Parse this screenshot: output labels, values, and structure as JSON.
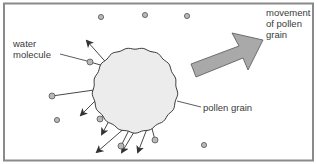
{
  "diagram": {
    "labels": {
      "water_molecule": "water\nmolecule",
      "pollen_grain": "pollen grain",
      "movement": "movement\nof pollen\ngrain"
    },
    "colors": {
      "frame": "#8a8a8a",
      "pollen_fill": "#ececec",
      "pollen_stroke": "#3a3a3a",
      "molecule_fill": "#b8b8b8",
      "molecule_stroke": "#555555",
      "big_arrow_fill": "#a9a9a9",
      "big_arrow_stroke": "#555555",
      "line": "#333333",
      "text": "#3a3a3a"
    },
    "elements": {
      "pollen_grain": {
        "cx": 135,
        "cy": 90,
        "r": 42
      },
      "free_molecules": [
        {
          "cx": 101,
          "cy": 17
        },
        {
          "cx": 145,
          "cy": 15
        },
        {
          "cx": 187,
          "cy": 16
        },
        {
          "cx": 57,
          "cy": 120
        },
        {
          "cx": 204,
          "cy": 145
        }
      ],
      "colliding_molecules": [
        {
          "mx": 90,
          "my": 62,
          "hx": 111,
          "hy": 68
        },
        {
          "mx": 52,
          "my": 96,
          "hx": 108,
          "hy": 88
        },
        {
          "mx": 100,
          "my": 119,
          "hx": 117,
          "hy": 106
        },
        {
          "mx": 121,
          "my": 146,
          "hx": 134,
          "hy": 120
        },
        {
          "mx": 155,
          "my": 140,
          "hx": 150,
          "hy": 121
        }
      ],
      "rebound_arrows": [
        {
          "x1": 111,
          "y1": 68,
          "x2": 87,
          "y2": 41
        },
        {
          "x1": 108,
          "y1": 88,
          "x2": 81,
          "y2": 115
        },
        {
          "x1": 117,
          "y1": 106,
          "x2": 102,
          "y2": 134
        },
        {
          "x1": 134,
          "y1": 120,
          "x2": 97,
          "y2": 152
        },
        {
          "x1": 140,
          "y1": 122,
          "x2": 122,
          "y2": 152
        },
        {
          "x1": 150,
          "y1": 121,
          "x2": 138,
          "y2": 152
        }
      ]
    }
  }
}
